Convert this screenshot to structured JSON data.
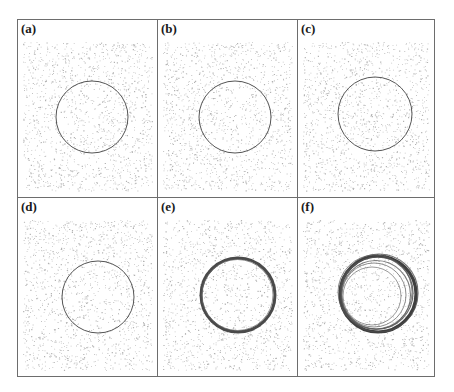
{
  "figure": {
    "layout": {
      "rows": 2,
      "cols": 3
    },
    "frame_color": "#6d6d6d",
    "ring_color": "#555555",
    "noise_color": "#9a9a9a",
    "panels": [
      {
        "label": "(a)",
        "ring": "thin-circle",
        "cx": 74,
        "cy": 97,
        "r": 36
      },
      {
        "label": "(b)",
        "ring": "thin-circle",
        "cx": 77,
        "cy": 97,
        "r": 36
      },
      {
        "label": "(c)",
        "ring": "thin-circle",
        "cx": 77,
        "cy": 94,
        "r": 37
      },
      {
        "label": "(d)",
        "ring": "thin-circle",
        "cx": 80,
        "cy": 99,
        "r": 36
      },
      {
        "label": "(e)",
        "ring": "thick-circle",
        "cx": 80,
        "cy": 97,
        "r": 37
      },
      {
        "label": "(f)",
        "ring": "multi-ring",
        "cx": 80,
        "cy": 96,
        "r": 38
      }
    ]
  }
}
